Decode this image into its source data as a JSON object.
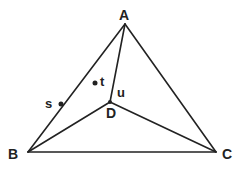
{
  "diagram": {
    "type": "geometry-triangle",
    "stroke_color": "#222222",
    "vertices": [
      {
        "id": "A",
        "label": "A",
        "x": 125,
        "y": 24
      },
      {
        "id": "B",
        "label": "B",
        "x": 28,
        "y": 152
      },
      {
        "id": "C",
        "label": "C",
        "x": 216,
        "y": 152
      },
      {
        "id": "D",
        "label": "D",
        "x": 110,
        "y": 102
      }
    ],
    "edges": [
      [
        "A",
        "B"
      ],
      [
        "B",
        "C"
      ],
      [
        "C",
        "A"
      ],
      [
        "A",
        "D"
      ],
      [
        "B",
        "D"
      ],
      [
        "C",
        "D"
      ]
    ],
    "points": [
      {
        "id": "s",
        "label": "s",
        "x": 61,
        "y": 104
      },
      {
        "id": "t",
        "label": "t",
        "x": 95,
        "y": 83
      }
    ],
    "annotations": [
      {
        "id": "u",
        "label": "u"
      }
    ]
  }
}
